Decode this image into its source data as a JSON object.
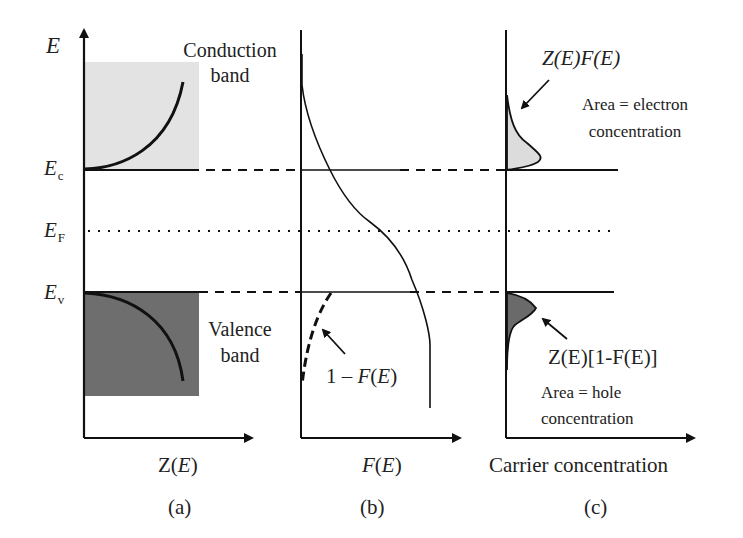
{
  "figure": {
    "axis_label_E": "E",
    "levels": {
      "Ec": {
        "main": "E",
        "sub": "c"
      },
      "EF": {
        "main": "E",
        "sub": "F"
      },
      "Ev": {
        "main": "E",
        "sub": "v"
      }
    },
    "panel_a": {
      "conduction_label_line1": "Conduction",
      "conduction_label_line2": "band",
      "valence_label_line1": "Valence",
      "valence_label_line2": "band",
      "xlabel_pre": "Z(",
      "xlabel_var": "E",
      "xlabel_post": ")",
      "caption": "(a)"
    },
    "panel_b": {
      "curve_label_pre": "1 – ",
      "curve_label_F": "F",
      "curve_label_mid": "(",
      "curve_label_E": "E",
      "curve_label_post": ")",
      "xlabel_F": "F",
      "xlabel_mid": "(",
      "xlabel_E": "E",
      "xlabel_post": ")",
      "caption": "(b)"
    },
    "panel_c": {
      "electron_curve_label": "Z(E)F(E)",
      "electron_area_line1": "Area = electron",
      "electron_area_line2": "concentration",
      "hole_curve_label": "Z(E)[1-F(E)]",
      "hole_area_line1": "Area = hole",
      "hole_area_line2": "concentration",
      "xlabel": "Carrier concentration",
      "caption": "(c)"
    },
    "colors": {
      "conduction_fill": "#e3e3e3",
      "valence_fill": "#6e6e6e",
      "electron_fill": "#dcdcdc",
      "hole_fill": "#6a6a6a",
      "line": "#111111"
    }
  }
}
